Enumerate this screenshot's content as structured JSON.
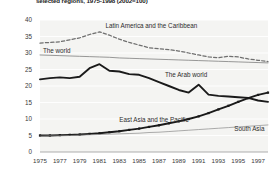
{
  "title": "selected regions, 1975-1998 (2002=100)",
  "chart_data": {
    "type": "line",
    "title": "selected regions, 1975-1998 (2002=100)",
    "xlabel": "",
    "ylabel": "",
    "xlim": [
      1975,
      1998
    ],
    "ylim": [
      0,
      40
    ],
    "grid": true,
    "legend_position": "inline-annotations",
    "x": [
      1975,
      1976,
      1977,
      1978,
      1979,
      1980,
      1981,
      1982,
      1983,
      1984,
      1985,
      1986,
      1987,
      1988,
      1989,
      1990,
      1991,
      1992,
      1993,
      1994,
      1995,
      1996,
      1997,
      1998
    ],
    "ytick_labels": [
      "0",
      "5",
      "10",
      "15",
      "20",
      "25",
      "30",
      "35",
      "40"
    ],
    "ytick_values": [
      0,
      5,
      10,
      15,
      20,
      25,
      30,
      35,
      40
    ],
    "xtick_labels": [
      "1975",
      "1977",
      "1979",
      "1981",
      "1983",
      "1985",
      "1987",
      "1989",
      "1991",
      "1993",
      "1995",
      "1997"
    ],
    "xtick_values": [
      1975,
      1977,
      1979,
      1981,
      1983,
      1985,
      1987,
      1989,
      1991,
      1993,
      1995,
      1997
    ],
    "series": [
      {
        "name": "Latin America and the Caribbean",
        "style": "dashed",
        "color": "#6f6f6f",
        "label_x": 1981.6,
        "label_y": 38.2,
        "values": [
          33.0,
          33.2,
          33.4,
          34.0,
          34.6,
          35.6,
          36.4,
          35.4,
          34.2,
          33.2,
          32.4,
          31.6,
          31.3,
          31.0,
          30.6,
          30.0,
          29.4,
          28.8,
          28.6,
          29.0,
          28.8,
          28.2,
          27.8,
          27.4
        ]
      },
      {
        "name": "The world",
        "style": "thin",
        "color": "#6e6e6e",
        "label_x": 1975.3,
        "label_y": 30.6,
        "values": [
          29.4,
          29.3,
          29.2,
          29.1,
          29.0,
          28.9,
          28.8,
          28.7,
          28.5,
          28.4,
          28.3,
          28.2,
          28.1,
          28.0,
          27.9,
          27.8,
          27.7,
          27.6,
          27.5,
          27.4,
          27.3,
          27.2,
          27.1,
          27.0
        ]
      },
      {
        "name": "The Arab world",
        "style": "thick",
        "color": "#1a1a1a",
        "label_x": 1987.6,
        "label_y": 23.6,
        "values": [
          22.0,
          22.4,
          22.6,
          22.4,
          22.8,
          25.4,
          26.6,
          24.6,
          24.4,
          23.6,
          23.4,
          22.4,
          21.2,
          20.0,
          18.8,
          18.0,
          20.4,
          17.4,
          17.0,
          16.8,
          16.6,
          16.4,
          15.6,
          15.2
        ]
      },
      {
        "name": "East Asia and the Pacific",
        "style": "thick-marker",
        "color": "#1a1a1a",
        "label_x": 1983.0,
        "label_y": 9.8,
        "values": [
          5.0,
          5.0,
          5.1,
          5.2,
          5.3,
          5.5,
          5.7,
          6.0,
          6.3,
          6.7,
          7.1,
          7.6,
          8.1,
          8.7,
          9.3,
          10.0,
          10.8,
          11.8,
          12.9,
          14.0,
          15.2,
          16.3,
          17.3,
          18.0
        ]
      },
      {
        "name": "South Asia",
        "style": "thin",
        "color": "#8a8a8a",
        "label_x": 1994.6,
        "label_y": 7.2,
        "values": [
          4.8,
          4.9,
          4.9,
          5.0,
          5.1,
          5.2,
          5.3,
          5.4,
          5.5,
          5.6,
          5.7,
          5.9,
          6.0,
          6.2,
          6.4,
          6.6,
          6.8,
          7.0,
          7.2,
          7.4,
          7.6,
          7.8,
          8.0,
          8.2
        ]
      }
    ]
  }
}
